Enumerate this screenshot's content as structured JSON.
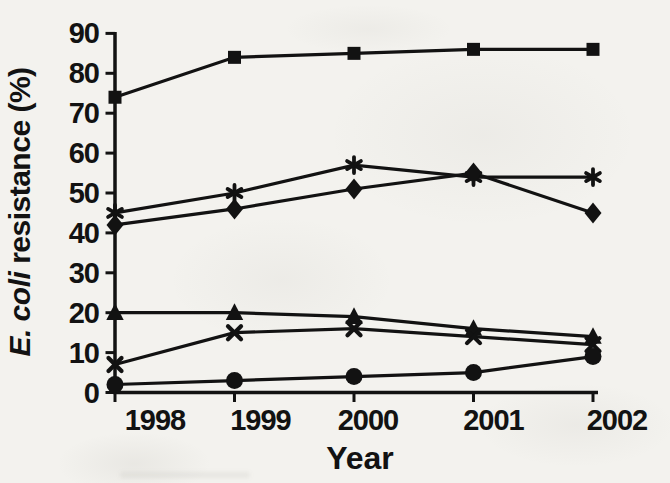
{
  "page": {
    "background_color": "#f3f2ee",
    "ink_color": "#121212",
    "figure_kind": "scanned book figure, black ink line chart, no legend"
  },
  "chart_data": {
    "type": "line",
    "title": "",
    "xlabel": "Year",
    "ylabel": "E. coli resistance (%)",
    "ylabel_parts": {
      "italic": "E. coli",
      "upright": " resistance (%)"
    },
    "x": [
      1998,
      1999,
      2000,
      2001,
      2002
    ],
    "x_tick_labels": [
      "1998",
      "1999",
      "2000",
      "2001",
      "2002"
    ],
    "y_ticks": [
      0,
      10,
      20,
      30,
      40,
      50,
      60,
      70,
      80,
      90
    ],
    "ylim": [
      0,
      90
    ],
    "grid": false,
    "legend_position": "none",
    "line_color": "#121212",
    "series": [
      {
        "name": "series-square",
        "marker": "square",
        "values": [
          74,
          84,
          85,
          86,
          86
        ]
      },
      {
        "name": "series-asterisk",
        "marker": "asterisk",
        "values": [
          45,
          50,
          57,
          54,
          54
        ]
      },
      {
        "name": "series-diamond",
        "marker": "diamond",
        "values": [
          42,
          46,
          51,
          55,
          45
        ]
      },
      {
        "name": "series-triangle",
        "marker": "triangle",
        "values": [
          20,
          20,
          19,
          16,
          14
        ]
      },
      {
        "name": "series-x",
        "marker": "x",
        "values": [
          7,
          15,
          16,
          14,
          12
        ]
      },
      {
        "name": "series-circle",
        "marker": "circle",
        "values": [
          2,
          3,
          4,
          5,
          9
        ]
      }
    ]
  }
}
